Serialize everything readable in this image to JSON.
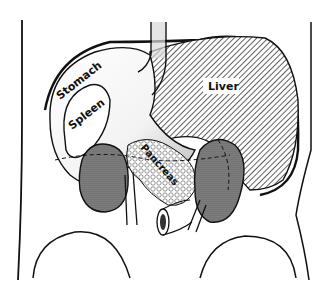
{
  "diagram": {
    "labels": {
      "stomach": "Stomach",
      "spleen": "Spleen",
      "liver": "Liver",
      "pancreas": "Pancreas"
    },
    "colors": {
      "outline": "#111111",
      "background": "#ffffff",
      "liver_hatch": "#444444",
      "kidney_fill": "#7a7a7a",
      "stipple": "#9a9a9a"
    }
  }
}
